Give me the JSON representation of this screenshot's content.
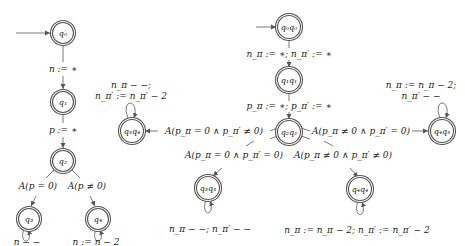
{
  "colors": {
    "stroke": "#555555",
    "text": "#222222",
    "background": "#ffffff"
  },
  "left_automaton": {
    "states": [
      {
        "id": "q0",
        "label": "q₀"
      },
      {
        "id": "q1",
        "label": "q₁"
      },
      {
        "id": "q2",
        "label": "q₂"
      },
      {
        "id": "q3",
        "label": "q₃"
      },
      {
        "id": "q4",
        "label": "q₄"
      }
    ],
    "edges": {
      "q0_q1": "n := ∗",
      "q1_q2": "p := ∗",
      "q2_q3": "A(p = 0)",
      "q2_q4": "A(p ≠ 0)",
      "q3_loop": "n − −",
      "q4_loop": "n := n − 2"
    }
  },
  "right_automaton": {
    "states": [
      {
        "id": "q0q0",
        "label": "q₀q₀"
      },
      {
        "id": "q1q1",
        "label": "q₁q₁"
      },
      {
        "id": "q2q2",
        "label": "q₂q₂"
      },
      {
        "id": "q3q4",
        "label": "q₃q₄"
      },
      {
        "id": "q4q3",
        "label": "q₄q₃"
      },
      {
        "id": "q3q3",
        "label": "q₃q₃"
      },
      {
        "id": "q4q4",
        "label": "q₄q₄"
      }
    ],
    "edges": {
      "q0q0_q1q1": "n_π := ∗; n_π′ := ∗",
      "q1q1_q2q2": "p_π := ∗; p_π′ := ∗",
      "q2q2_q3q4": "A(p_π = 0 ∧ p_π′ ≠ 0)",
      "q2q2_q4q3": "A(p_π ≠ 0 ∧ p_π′ = 0)",
      "q2q2_q3q3": "A(p_π = 0 ∧ p_π′ = 0)",
      "q2q2_q4q4": "A(p_π ≠ 0 ∧ p_π′ ≠ 0)",
      "q3q4_loop_line1": "n_π − −;",
      "q3q4_loop_line2": "n_π′ := n_π′ − 2",
      "q4q3_loop_line1": "n_π := n_π − 2;",
      "q4q3_loop_line2": "n_π′ − −",
      "q3q3_loop": "n_π − −; n_π′ − −",
      "q4q4_loop": "n_π := n_π − 2; n_π′ := n_π′ − 2"
    }
  }
}
